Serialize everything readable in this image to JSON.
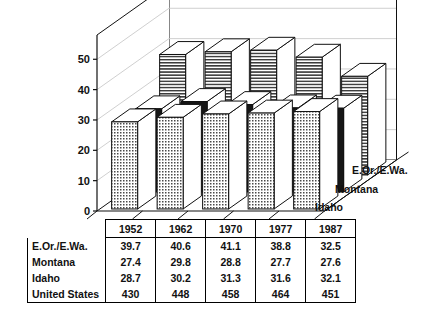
{
  "chart_data": {
    "type": "bar",
    "title": "Billion cubic feet",
    "xlabel": "",
    "ylabel": "",
    "ylim": [
      0,
      50
    ],
    "yticks": [
      0,
      10,
      20,
      30,
      40,
      50
    ],
    "grid": true,
    "legend_position": "depth-axis-right",
    "categories": [
      "1952",
      "1962",
      "1970",
      "1977",
      "1987"
    ],
    "series": [
      {
        "name": "Idaho",
        "values": [
          28.7,
          30.2,
          31.3,
          31.6,
          32.1
        ],
        "fill": "dot-grid"
      },
      {
        "name": "Montana",
        "values": [
          27.4,
          29.8,
          28.8,
          27.7,
          27.6
        ],
        "fill": "solid-black"
      },
      {
        "name": "E.Or./E.Wa.",
        "values": [
          39.7,
          40.6,
          41.1,
          38.8,
          32.5
        ],
        "fill": "horizontal-stripes"
      }
    ],
    "unplotted_series": [
      {
        "name": "United States",
        "values": [
          430,
          448,
          458,
          464,
          451
        ]
      }
    ]
  },
  "chart": {
    "title": "Billion cubic feet",
    "ytick_labels": [
      "50",
      "40",
      "30",
      "20",
      "10",
      "0"
    ],
    "depth_labels": [
      "E.Or./E.Wa.",
      "Montana",
      "Idaho"
    ]
  },
  "table": {
    "columns": [
      "1952",
      "1962",
      "1970",
      "1977",
      "1987"
    ],
    "rows": [
      {
        "label": "E.Or./E.Wa.",
        "values": [
          "39.7",
          "40.6",
          "41.1",
          "38.8",
          "32.5"
        ]
      },
      {
        "label": "Montana",
        "values": [
          "27.4",
          "29.8",
          "28.8",
          "27.7",
          "27.6"
        ]
      },
      {
        "label": "Idaho",
        "values": [
          "28.7",
          "30.2",
          "31.3",
          "31.6",
          "32.1"
        ]
      },
      {
        "label": "United States",
        "values": [
          "430",
          "448",
          "458",
          "464",
          "451"
        ]
      }
    ]
  },
  "colors": {
    "ink": "#111111",
    "background": "#ffffff",
    "gridline": "#c9c9c9",
    "bar_black": "#161616",
    "bar_light": "#e8e8e8"
  }
}
